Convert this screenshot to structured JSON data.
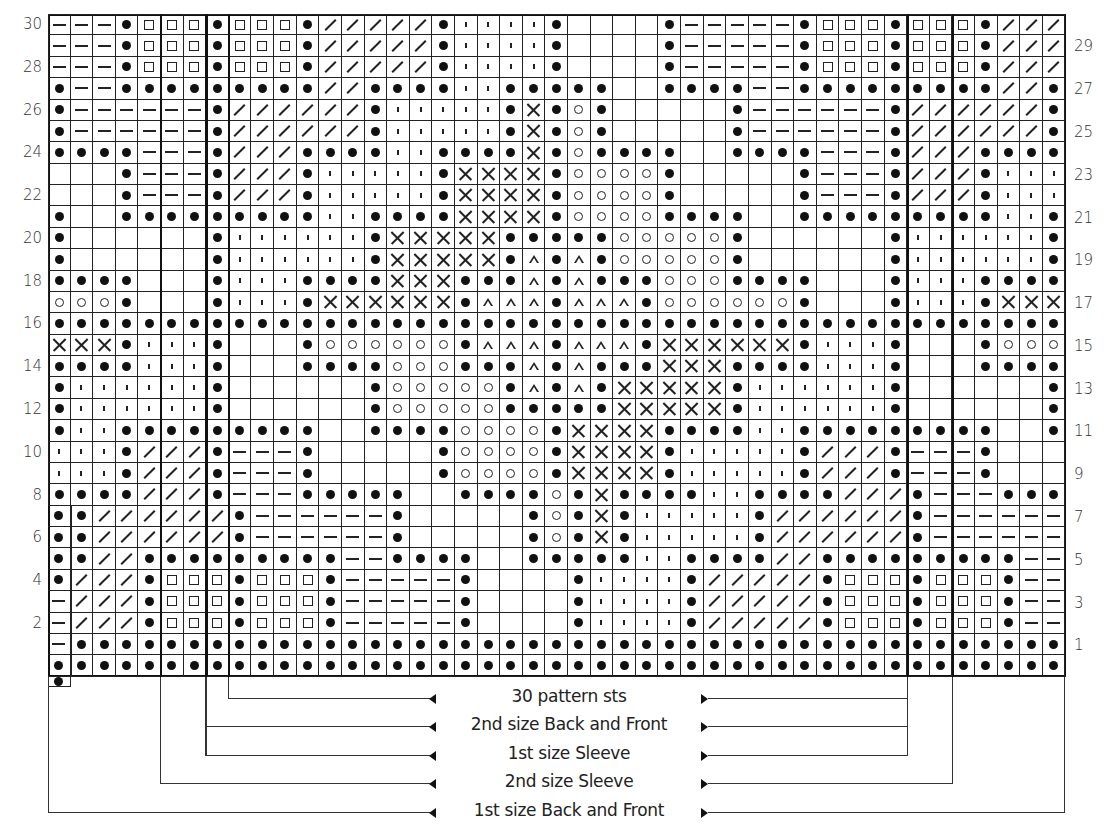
{
  "chart": {
    "columns": 45,
    "rows": 31,
    "row_labels_left": [
      "30",
      "28",
      "26",
      "24",
      "22",
      "20",
      "18",
      "16",
      "14",
      "12",
      "10",
      "8",
      "6",
      "4",
      "2"
    ],
    "row_labels_right": [
      "29",
      "27",
      "25",
      "23",
      "21",
      "19",
      "17",
      "15",
      "13",
      "11",
      "9",
      "7",
      "5",
      "3",
      "1"
    ],
    "symbol_key": {
      "B": "filled-dot",
      "-": "dash",
      "S": "open-square",
      "/": "slash",
      "'": "tick",
      "_": "blank",
      "X": "cross",
      "O": "open-circle",
      "T": "open-triangle"
    },
    "grid_top_to_bottom": [
      "---BSSSBSSSB/////B''''B____B-----BSSSBSSSB///",
      "---BSSSBSSSB/////B''''B____B-----BSSSBSSSB///",
      "---BSSSBSSSB/////B''''B____B-----BSSSBSSSB///",
      "B--BBBBBBBBB//BBBB''BBBBB__BBBB--BBBBBBBBB//B",
      "B------B//////B'''''BXBOB_____B------B//////B",
      "B------B//////B'''''BXBOB_____B------B//////B",
      "BBBB---B///BBBB''BBBBXBOBBBB__BBBB---B///BBBB",
      "___B---B///B'''''BXXXXBOOOOB_____B---B///B'''",
      "___B---B///B'''''BXXXXBOOOOB_____B---B///B'''",
      "B__BBBBBBBBB''BBBBXXXXBOOOOBBBB__BBBBBBBBB''B",
      "B______B''''''BXXXXXBBBBBOOOOOB______B''''''B",
      "B______B''''''BXXXXXBTBTBOOOOOB______B''''''B",
      "BBBB___B'''BBBBXXXBBBTBTBBBOOOBBBB___B'''BBBB",
      "OOOB___B'''BXXXXXXBTTTBTTTBOOOOOOB___B'''BXXX",
      "BBBBBBBBBBBBBBBBBBBBBBBBBBBBBBBBBBBBBBBBBBBBB",
      "XXXB'''B___BOOOOOOBTTTBTTTBXXXXXXB'''B___BOOO",
      "BBBB'''B___BBBBOOOBBBTBTBBBXXXBBBB'''B___BBBB",
      "B''''''B______BOOOOOBTBTBXXXXXB''''''B______B",
      "B''''''B______BOOOOOBBBBBXXXXXB''''''B______B",
      "B''BBBBBBBBB__BBBBOOOOBXXXXBBBB''BBBBBBBBB__B",
      "'''B///B---B_____BOOOOBXXXXB'''''B///B---B___",
      "'''B///B---B_____BOOOOBXXXXB'''''B///B---B___",
      "BBBB///B---BBBBB__BBBBOBXBBBB''BBBB///B---BBBB",
      "B//////B------B_____BOBXB'''''B//////B------B",
      "B//////B------B_____BOBXB'''''B//////B------B",
      "B//BBBBBBBBB--BBBB__BBBBB''BBBB//BBBBBBBBB--B",
      "///BSSSBSSSB-----B____B''''B/////BSSSBSSSB---",
      "///BSSSBSSSB-----B____B''''B/////BSSSBSSSB---",
      "///BSSSBSSSB-----B____B''''B/////BSSSBSSSB---",
      "BBBBBBBBBBBBBBBBBBBBBBBBBBBBBBBBBBBBBBBBBBBBB",
      "BBBBBBBBBBBBBBBBBBBBBBBBBBBBBBBBBBBBBBBBBBBBB"
    ],
    "thick_column_boundaries": [
      5,
      7,
      8,
      38,
      40
    ]
  },
  "brackets": [
    {
      "label": "30 pattern sts",
      "from_col": 8,
      "to_col": 38
    },
    {
      "label": "2nd size Back and Front",
      "from_col": 7,
      "to_col": 38
    },
    {
      "label": "1st size Sleeve",
      "from_col": 7,
      "to_col": 38
    },
    {
      "label": "2nd size Sleeve",
      "from_col": 5,
      "to_col": 40
    },
    {
      "label": "1st size Back and Front",
      "from_col": 0,
      "to_col": 45
    }
  ]
}
